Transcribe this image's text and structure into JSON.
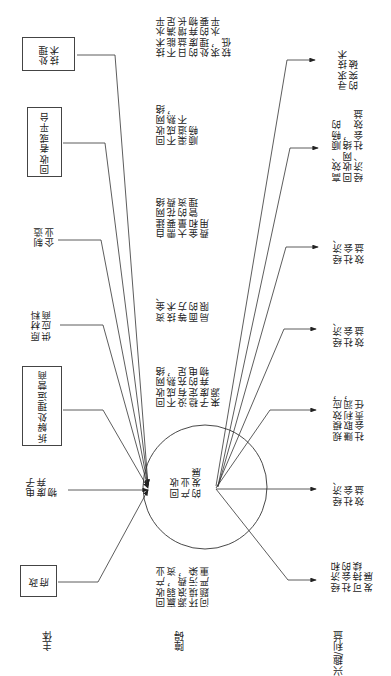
{
  "diagram": {
    "orientation": "rotated-90-ccw",
    "center": {
      "label": "回收\n产业\n的发展"
    },
    "row_headers": {
      "subjects": "主体",
      "barriers": "障碍",
      "interests": "兴趣/利益"
    },
    "subjects": [
      {
        "id": "processing-tech",
        "label": "处理\n技术",
        "boxed": true
      },
      {
        "id": "collector-platform",
        "label": "回收者或平台",
        "boxed": true
      },
      {
        "id": "manufacturer",
        "label": "制造\n企业",
        "boxed": false
      },
      {
        "id": "raw-material-supplier",
        "label": "原材料\n供应商",
        "boxed": false
      },
      {
        "id": "dismantling-operator",
        "label": "拆解处理运营商",
        "boxed": true
      },
      {
        "id": "e-waste",
        "label": "电子\n废弃\n物",
        "boxed": false
      },
      {
        "id": "government",
        "label": "政\n府",
        "boxed": true
      }
    ],
    "barriers": [
      {
        "for": "processing-tech",
        "text": "技术水平\n不能满足\n日益增长\n的废弃物\n处理的要\n求，水平\n较低"
      },
      {
        "for": "collector-platform",
        "text": "回收网络\n不成熟，\n渠道不\n顺畅"
      },
      {
        "for": "manufacturer",
        "text": "自建网络\n需要花费\n大量的资\n金和管理\n费用"
      },
      {
        "for": "raw-material-supplier",
        "text": "资金、\n技术\n等方\n面的\n局限"
      },
      {
        "for": "dismantling-operator",
        "text": "回收网络\n不成熟，\n没有充足\n稳定的电\n子废弃物\n来源"
      },
      {
        "for": "government",
        "text": "回收产业\n赢弱，资\n源浪费，\n环境污染\n问题严重"
      }
    ],
    "interests": [
      {
        "for": "processing-tech",
        "text": "寻求技术\n的突破"
      },
      {
        "for": "collector-platform",
        "text": "高效、顺畅的\n回收网络，\n经济、社会效益"
      },
      {
        "for": "manufacturer",
        "text": "经济、\n社会\n效益"
      },
      {
        "for": "raw-material-supplier",
        "text": "经济、\n社会\n效益"
      },
      {
        "for": "dismantling-operator",
        "text": "规模效应，\n赚取利润，\n社会责任"
      },
      {
        "for": "e-waste",
        "text": "经济、\n社会\n效益"
      },
      {
        "for": "government",
        "text": "经济和\n社会的\n可持续\n发展"
      }
    ]
  }
}
